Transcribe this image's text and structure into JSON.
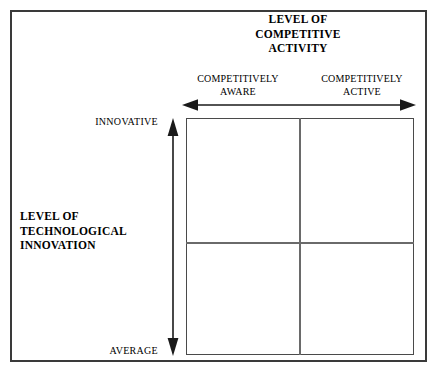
{
  "figure": {
    "type": "two-by-two-matrix-diagram",
    "top_axis_title": {
      "lines": [
        "LEVEL OF",
        "COMPETITIVE",
        "ACTIVITY"
      ]
    },
    "left_axis_title": {
      "lines": [
        "LEVEL OF",
        "TECHNOLOGICAL",
        "INNOVATION"
      ]
    },
    "column_headers": [
      {
        "lines": [
          "COMPETITIVELY",
          "AWARE"
        ]
      },
      {
        "lines": [
          "COMPETITIVELY",
          "ACTIVE"
        ]
      }
    ],
    "vertical_axis_labels": {
      "top": "INNOVATIVE",
      "bottom": "AVERAGE"
    },
    "arrows": {
      "horizontal": "double-headed-arrow",
      "vertical": "double-headed-arrow"
    },
    "colors": {
      "ink": "#000000",
      "frame": "#3a3a3a",
      "grid": "#4a4a4a",
      "divider": "#6a6a6a",
      "background": "#ffffff"
    }
  }
}
